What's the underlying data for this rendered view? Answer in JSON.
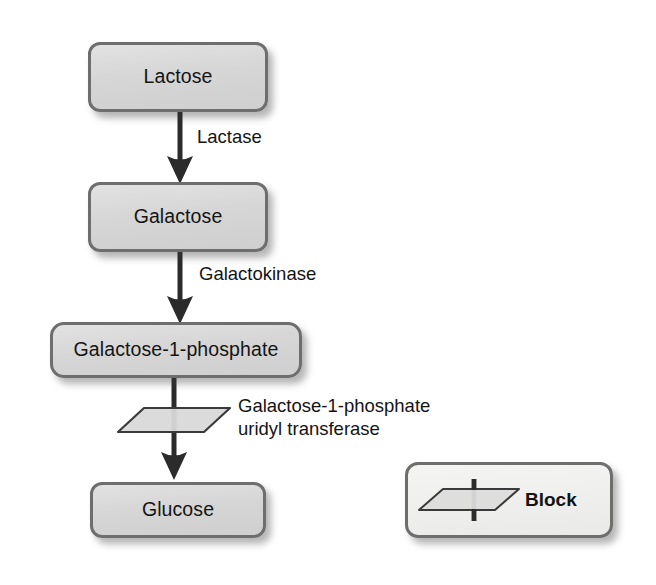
{
  "diagram": {
    "nodes": [
      {
        "id": "lactose",
        "label": "Lactose"
      },
      {
        "id": "galactose",
        "label": "Galactose"
      },
      {
        "id": "gal1p",
        "label": "Galactose-1-phosphate"
      },
      {
        "id": "glucose",
        "label": "Glucose"
      }
    ],
    "enzymes": [
      {
        "id": "lactase",
        "label": "Lactase"
      },
      {
        "id": "galactokinase",
        "label": "Galactokinase"
      },
      {
        "id": "galt",
        "line1": "Galactose-1-phosphate",
        "line2": "uridyl transferase"
      }
    ],
    "legend": {
      "label": "Block",
      "symbol": "block-parallelogram-icon"
    },
    "colors": {
      "node_fill": "#d8d8d8",
      "node_border": "#6e6e6e",
      "legend_fill": "#efefed",
      "arrow": "#2b2b2b",
      "text": "#141414",
      "shadow": "#3c3c3c"
    }
  }
}
